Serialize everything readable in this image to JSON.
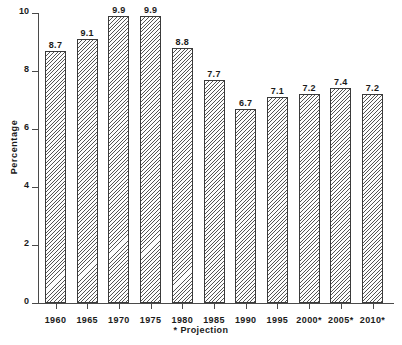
{
  "chart_data": {
    "type": "bar",
    "title": "",
    "xlabel": "",
    "ylabel": "Percentage",
    "categories": [
      "1960",
      "1965",
      "1970",
      "1975",
      "1980",
      "1985",
      "1990",
      "1995",
      "2000*",
      "2005*",
      "2010*"
    ],
    "values": [
      8.7,
      9.1,
      9.9,
      9.9,
      8.8,
      7.7,
      6.7,
      7.1,
      7.2,
      7.4,
      7.2
    ],
    "value_labels": [
      "8.7",
      "9.1",
      "9.9",
      "9.9",
      "8.8",
      "7.7",
      "6.7",
      "7.1",
      "7.2",
      "7.4",
      "7.2"
    ],
    "ylim": [
      0,
      10
    ],
    "yticks": [
      0,
      2,
      4,
      6,
      8,
      10
    ],
    "ytick_labels": [
      "0",
      "2",
      "4",
      "6",
      "8",
      "10"
    ],
    "grid": false,
    "legend": false,
    "legend_position": "none",
    "footnote": "* Projection",
    "bar_color": "#fdfdfd",
    "bar_hatch_color": "#555555",
    "bar_edge_color": "#3a3a3a",
    "axis_color": "#4a4a4a",
    "text_color": "#1a1a1a"
  }
}
